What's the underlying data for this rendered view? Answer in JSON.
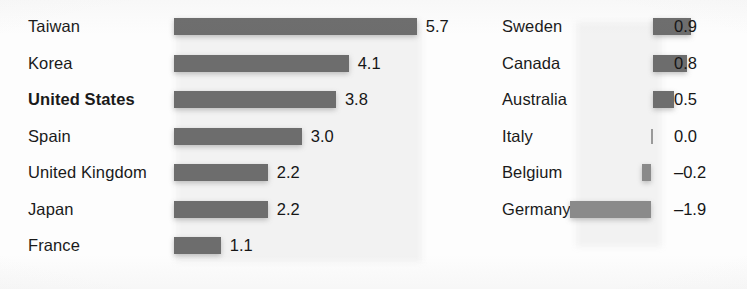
{
  "chart_data": {
    "type": "bar",
    "title": "",
    "subtitle": "",
    "xlabel": "",
    "ylabel": "",
    "orientation": "horizontal",
    "grid": false,
    "legend": null,
    "zero_line": true,
    "value_format": "one-decimal",
    "negative_sign": "en-dash",
    "axis_range": [
      -1.9,
      5.7
    ],
    "units_per_pixel": 0.0235,
    "categories": [
      "Taiwan",
      "Korea",
      "United States",
      "Spain",
      "United Kingdom",
      "Japan",
      "France",
      "Sweden",
      "Canada",
      "Australia",
      "Italy",
      "Belgium",
      "Germany"
    ],
    "values": [
      5.7,
      4.1,
      3.8,
      3.0,
      2.2,
      2.2,
      1.1,
      0.9,
      0.8,
      0.5,
      0.0,
      -0.2,
      -1.9
    ],
    "highlighted": [
      "United States"
    ],
    "colors": {
      "bar_positive": "#6d6d6d",
      "bar_negative": "#8a8a8a",
      "zero_tick": "#9a9a9a",
      "text": "#1a1a1a",
      "background": "#fdfdfd"
    }
  },
  "columns": {
    "left": {
      "rows": [
        {
          "label": "Taiwan",
          "value": 5.7,
          "value_text": "5.7",
          "bold": false
        },
        {
          "label": "Korea",
          "value": 4.1,
          "value_text": "4.1",
          "bold": false
        },
        {
          "label": "United States",
          "value": 3.8,
          "value_text": "3.8",
          "bold": true
        },
        {
          "label": "Spain",
          "value": 3.0,
          "value_text": "3.0",
          "bold": false
        },
        {
          "label": "United Kingdom",
          "value": 2.2,
          "value_text": "2.2",
          "bold": false
        },
        {
          "label": "Japan",
          "value": 2.2,
          "value_text": "2.2",
          "bold": false
        },
        {
          "label": "France",
          "value": 1.1,
          "value_text": "1.1",
          "bold": false
        }
      ]
    },
    "right": {
      "rows": [
        {
          "label": "Sweden",
          "value": 0.9,
          "value_text": "0.9",
          "bold": false
        },
        {
          "label": "Canada",
          "value": 0.8,
          "value_text": "0.8",
          "bold": false
        },
        {
          "label": "Australia",
          "value": 0.5,
          "value_text": "0.5",
          "bold": false
        },
        {
          "label": "Italy",
          "value": 0.0,
          "value_text": "0.0",
          "bold": false
        },
        {
          "label": "Belgium",
          "value": -0.2,
          "value_text": "–0.2",
          "bold": false
        },
        {
          "label": "Germany",
          "value": -1.9,
          "value_text": "–1.9",
          "bold": false
        }
      ]
    }
  }
}
